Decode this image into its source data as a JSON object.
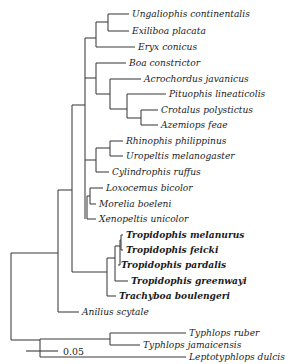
{
  "figure": {
    "type": "phylogenetic-tree",
    "layout": "rectangular-cladogram",
    "background_color": "#ffffff",
    "line_color": "#3a3a3a",
    "text_color": "#1b1b1b"
  },
  "scale_bar": {
    "label": "0.05",
    "units_per_px": 0.05,
    "x_start": 26,
    "x_end": 58,
    "y": 351
  },
  "taxa": [
    {
      "name": "Ungaliophis continentalis",
      "row": 0,
      "y": 14,
      "tip_x": 129,
      "bold": false
    },
    {
      "name": "Exiliboa placata",
      "row": 1,
      "y": 31,
      "tip_x": 129,
      "bold": false
    },
    {
      "name": "Eryx conicus",
      "row": 2,
      "y": 47,
      "tip_x": 135,
      "bold": false
    },
    {
      "name": "Boa constrictor",
      "row": 3,
      "y": 63,
      "tip_x": 126,
      "bold": false
    },
    {
      "name": "Acrochordus javanicus",
      "row": 4,
      "y": 79,
      "tip_x": 141,
      "bold": false
    },
    {
      "name": "Pituophis lineaticolis",
      "row": 5,
      "y": 94,
      "tip_x": 166,
      "bold": false
    },
    {
      "name": "Crotalus polystictus",
      "row": 6,
      "y": 110,
      "tip_x": 158,
      "bold": false
    },
    {
      "name": "Azemiops feae",
      "row": 7,
      "y": 125,
      "tip_x": 158,
      "bold": false
    },
    {
      "name": "Rhinophis philippinus",
      "row": 8,
      "y": 141,
      "tip_x": 123,
      "bold": false
    },
    {
      "name": "Uropeltis melanogaster",
      "row": 9,
      "y": 156,
      "tip_x": 123,
      "bold": false
    },
    {
      "name": "Cylindrophis ruffus",
      "row": 10,
      "y": 172,
      "tip_x": 109,
      "bold": false
    },
    {
      "name": "Loxocemus bicolor",
      "row": 11,
      "y": 188,
      "tip_x": 103,
      "bold": false
    },
    {
      "name": "Morelia boeleni",
      "row": 12,
      "y": 204,
      "tip_x": 96,
      "bold": false
    },
    {
      "name": "Xenopeltis unicolor",
      "row": 13,
      "y": 219,
      "tip_x": 96,
      "bold": false
    },
    {
      "name": "Tropidophis melanurus",
      "row": 14,
      "y": 235,
      "tip_x": 123,
      "bold": true
    },
    {
      "name": "Tropidophis feicki",
      "row": 15,
      "y": 250,
      "tip_x": 123,
      "bold": true
    },
    {
      "name": "Tropidophis pardalis",
      "row": 16,
      "y": 265,
      "tip_x": 118,
      "bold": true
    },
    {
      "name": "Tropidophis greenwayi",
      "row": 17,
      "y": 281,
      "tip_x": 128,
      "bold": true
    },
    {
      "name": "Trachyboa boulengeri",
      "row": 18,
      "y": 296,
      "tip_x": 116,
      "bold": true
    },
    {
      "name": "Anilius scytale",
      "row": 19,
      "y": 312,
      "tip_x": 79,
      "bold": false
    },
    {
      "name": "Typhlops ruber",
      "row": 20,
      "y": 333,
      "tip_x": 186,
      "bold": false
    },
    {
      "name": "Typhlops jamaicensis",
      "row": 21,
      "y": 345,
      "tip_x": 140,
      "bold": false
    },
    {
      "name": "Leptotyphlops dulcis",
      "row": 22,
      "y": 357,
      "tip_x": 186,
      "bold": false
    }
  ],
  "branches": [
    {
      "id": "root-vertical",
      "x1": 11,
      "y1": 253,
      "x2": 11,
      "y2": 340
    },
    {
      "id": "root-to-upper",
      "x1": 11,
      "y1": 253,
      "x2": 58,
      "y2": 253
    },
    {
      "id": "root-to-lower",
      "x1": 11,
      "y1": 340,
      "x2": 40,
      "y2": 340
    },
    {
      "id": "n-alethino-vertical",
      "x1": 58,
      "y1": 190,
      "x2": 58,
      "y2": 312
    },
    {
      "id": "n-alethino-to-anilius",
      "x1": 58,
      "y1": 312,
      "x2": 79,
      "y2": 312
    },
    {
      "id": "n-core-vertical",
      "x1": 72,
      "y1": 105,
      "x2": 72,
      "y2": 272
    },
    {
      "id": "n-core-stem",
      "x1": 58,
      "y1": 190,
      "x2": 72,
      "y2": 190
    },
    {
      "id": "n-macro-vertical",
      "x1": 85,
      "y1": 38,
      "x2": 85,
      "y2": 219
    },
    {
      "id": "n-macro-stem",
      "x1": 72,
      "y1": 105,
      "x2": 85,
      "y2": 105
    },
    {
      "id": "n-boa-vertical",
      "x1": 96,
      "y1": 22,
      "x2": 96,
      "y2": 47
    },
    {
      "id": "n-boa-stem",
      "x1": 85,
      "y1": 38,
      "x2": 96,
      "y2": 38
    },
    {
      "id": "n-ungal-vertical",
      "x1": 108,
      "y1": 14,
      "x2": 108,
      "y2": 31
    },
    {
      "id": "n-ungal-stem",
      "x1": 96,
      "y1": 22,
      "x2": 108,
      "y2": 22
    },
    {
      "id": "t-ungaliophis",
      "x1": 108,
      "y1": 14,
      "x2": 129,
      "y2": 14
    },
    {
      "id": "t-exiliboa",
      "x1": 108,
      "y1": 31,
      "x2": 129,
      "y2": 31
    },
    {
      "id": "t-eryx",
      "x1": 96,
      "y1": 47,
      "x2": 135,
      "y2": 47
    },
    {
      "id": "n-caeno-vertical",
      "x1": 96,
      "y1": 63,
      "x2": 96,
      "y2": 94
    },
    {
      "id": "n-caeno-stem",
      "x1": 85,
      "y1": 78,
      "x2": 96,
      "y2": 78
    },
    {
      "id": "t-boa",
      "x1": 96,
      "y1": 63,
      "x2": 126,
      "y2": 63
    },
    {
      "id": "n-acro-vertical",
      "x1": 110,
      "y1": 79,
      "x2": 110,
      "y2": 109
    },
    {
      "id": "n-acro-stem",
      "x1": 96,
      "y1": 94,
      "x2": 110,
      "y2": 94
    },
    {
      "id": "t-acrochordus",
      "x1": 110,
      "y1": 79,
      "x2": 141,
      "y2": 79
    },
    {
      "id": "n-colub-vertical",
      "x1": 127,
      "y1": 94,
      "x2": 127,
      "y2": 118
    },
    {
      "id": "n-colub-stem",
      "x1": 110,
      "y1": 109,
      "x2": 127,
      "y2": 109
    },
    {
      "id": "t-pituophis",
      "x1": 127,
      "y1": 94,
      "x2": 166,
      "y2": 94
    },
    {
      "id": "n-viper-vertical",
      "x1": 141,
      "y1": 110,
      "x2": 141,
      "y2": 125
    },
    {
      "id": "n-viper-stem",
      "x1": 127,
      "y1": 118,
      "x2": 141,
      "y2": 118
    },
    {
      "id": "t-crotalus",
      "x1": 141,
      "y1": 110,
      "x2": 158,
      "y2": 110
    },
    {
      "id": "t-azemiops",
      "x1": 141,
      "y1": 125,
      "x2": 158,
      "y2": 125
    },
    {
      "id": "n-uropel-vertical",
      "x1": 96,
      "y1": 148,
      "x2": 96,
      "y2": 172
    },
    {
      "id": "n-uropel-stem",
      "x1": 85,
      "y1": 160,
      "x2": 96,
      "y2": 160
    },
    {
      "id": "t-cylindrophis",
      "x1": 96,
      "y1": 172,
      "x2": 109,
      "y2": 172
    },
    {
      "id": "n-rhino-vertical",
      "x1": 110,
      "y1": 141,
      "x2": 110,
      "y2": 156
    },
    {
      "id": "n-rhino-stem",
      "x1": 96,
      "y1": 148,
      "x2": 110,
      "y2": 148
    },
    {
      "id": "t-rhinophis",
      "x1": 110,
      "y1": 141,
      "x2": 123,
      "y2": 141
    },
    {
      "id": "t-uropeltis",
      "x1": 110,
      "y1": 156,
      "x2": 123,
      "y2": 156
    },
    {
      "id": "n-henoph-vertical",
      "x1": 87,
      "y1": 196,
      "x2": 87,
      "y2": 219
    },
    {
      "id": "n-lox-vertical",
      "x1": 90,
      "y1": 188,
      "x2": 90,
      "y2": 204
    },
    {
      "id": "n-lox-stem",
      "x1": 87,
      "y1": 196,
      "x2": 90,
      "y2": 196
    },
    {
      "id": "t-loxocemus",
      "x1": 90,
      "y1": 188,
      "x2": 103,
      "y2": 188
    },
    {
      "id": "t-morelia",
      "x1": 90,
      "y1": 204,
      "x2": 96,
      "y2": 204
    },
    {
      "id": "t-xenopeltis",
      "x1": 87,
      "y1": 219,
      "x2": 96,
      "y2": 219
    },
    {
      "id": "n-tropi-vertical",
      "x1": 107,
      "y1": 258,
      "x2": 107,
      "y2": 296
    },
    {
      "id": "n-tropi-stem",
      "x1": 72,
      "y1": 272,
      "x2": 107,
      "y2": 272
    },
    {
      "id": "t-trachyboa",
      "x1": 107,
      "y1": 296,
      "x2": 116,
      "y2": 296
    },
    {
      "id": "n-trop2-vertical",
      "x1": 115,
      "y1": 246,
      "x2": 115,
      "y2": 281
    },
    {
      "id": "n-trop2-stem",
      "x1": 107,
      "y1": 258,
      "x2": 115,
      "y2": 258
    },
    {
      "id": "t-greenwayi",
      "x1": 115,
      "y1": 281,
      "x2": 128,
      "y2": 281
    },
    {
      "id": "n-trop3-vertical",
      "x1": 120,
      "y1": 240,
      "x2": 120,
      "y2": 265
    },
    {
      "id": "n-trop3-stem",
      "x1": 115,
      "y1": 246,
      "x2": 120,
      "y2": 246
    },
    {
      "id": "t-pardalis",
      "x1": 120,
      "y1": 265,
      "x2": 118,
      "y2": 265
    },
    {
      "id": "n-trop4-vertical",
      "x1": 121,
      "y1": 235,
      "x2": 121,
      "y2": 250
    },
    {
      "id": "n-trop4-stem",
      "x1": 120,
      "y1": 240,
      "x2": 121,
      "y2": 240
    },
    {
      "id": "t-melanurus",
      "x1": 121,
      "y1": 235,
      "x2": 123,
      "y2": 235
    },
    {
      "id": "t-feicki",
      "x1": 121,
      "y1": 250,
      "x2": 123,
      "y2": 250
    },
    {
      "id": "n-scolec-vertical",
      "x1": 40,
      "y1": 339,
      "x2": 40,
      "y2": 357
    },
    {
      "id": "t-leptotyphlops",
      "x1": 40,
      "y1": 357,
      "x2": 186,
      "y2": 357
    },
    {
      "id": "n-typh-vertical",
      "x1": 110,
      "y1": 333,
      "x2": 110,
      "y2": 345
    },
    {
      "id": "n-typh-stem",
      "x1": 40,
      "y1": 339,
      "x2": 110,
      "y2": 339
    },
    {
      "id": "t-typhlops-ruber",
      "x1": 110,
      "y1": 333,
      "x2": 186,
      "y2": 333
    },
    {
      "id": "t-typhlops-jam",
      "x1": 110,
      "y1": 345,
      "x2": 140,
      "y2": 345
    }
  ],
  "tree_structure": {
    "newick_like": "(((((((Ungaliophis continentalis,Exiliboa placata),Eryx conicus),(Boa constrictor,(Acrochordus javanicus,(Pituophis lineaticolis,(Crotalus polystictus,Azemiops feae))))),((Rhinophis philippinus,Uropeltis melanogaster),Cylindrophis ruffus)),((Loxocemus bicolor,Morelia boeleni),Xenopeltis unicolor)),((((Tropidophis melanurus,Tropidophis feicki),Tropidophis pardalis),Tropidophis greenwayi),Trachyboa boulengeri)),Anilius scytale),((Typhlops ruber,Typhlops jamaicensis),Leptotyphlops dulcis)"
  }
}
